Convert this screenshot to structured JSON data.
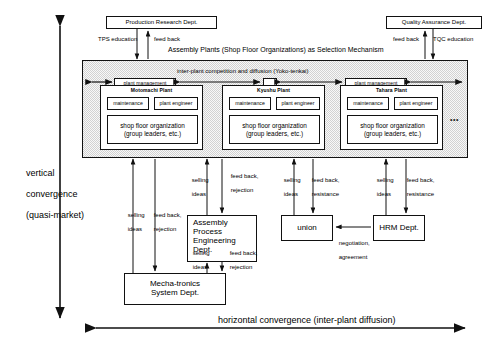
{
  "diagram": {
    "title_main": "Assembly Plants (Shop Floor Organizations) as Selection Mechanism",
    "region_label": "inter-plant competition and diffusion (Yoko-tenkai)",
    "ellipsis": "•••"
  },
  "top_departments": [
    {
      "name": "production-research-dept",
      "label": "Production Research Dept."
    },
    {
      "name": "quality-assurance-dept",
      "label": "Quality Assurance Dept."
    }
  ],
  "top_edge_labels": {
    "tps_education": "TPS education",
    "feed_back_left": "feed back",
    "feed_back_right": "feed back",
    "tqc_education": "TQC education"
  },
  "plants": [
    {
      "name": "motomachi-plant",
      "title": "Motomachi Plant",
      "maintenance": "maintenance",
      "plant_engineer": "plant engineer",
      "shop_floor_line1": "shop floor organization",
      "shop_floor_line2": "(group leaders, etc.)"
    },
    {
      "name": "kyushu-plant",
      "title": "Kyushu Plant",
      "maintenance": "maintenance",
      "plant_engineer": "plant engineer",
      "shop_floor_line1": "shop floor organization",
      "shop_floor_line2": "(group leaders, etc.)"
    },
    {
      "name": "tahara-plant",
      "title": "Tahara Plant",
      "maintenance": "maintenance",
      "plant_engineer": "plant engineer",
      "shop_floor_line1": "shop floor organization",
      "shop_floor_line2": "(group leaders, etc.)"
    }
  ],
  "plant_management": {
    "label_left": "plant management",
    "label_right": "plant management"
  },
  "lower_departments": {
    "assembly_process_engineering": {
      "line1": "Assembly",
      "line2": "Process",
      "line3": "Engineering",
      "line4": "Dept."
    },
    "union": "union",
    "hrm_dept": "HRM Dept.",
    "mechatronics": {
      "line1": "Mecha-tronics",
      "line2": "System Dept."
    }
  },
  "edge_labels": {
    "selling_ideas_1_l1": "selling",
    "selling_ideas_1_l2": "ideas",
    "feed_back_rejection_l1": "feed back,",
    "feed_back_rejection_l2": "rejection",
    "feed_back_resistance_l1": "feed back,",
    "feed_back_resistance_l2": "resistance",
    "negotiation_l1": "negotiation,",
    "negotiation_l2": "agreement"
  },
  "axes": {
    "vertical_l1": "vertical",
    "vertical_l2": "convergence",
    "vertical_l3": "(quasi-market)",
    "horizontal": "horizontal convergence (inter-plant diffusion)"
  }
}
